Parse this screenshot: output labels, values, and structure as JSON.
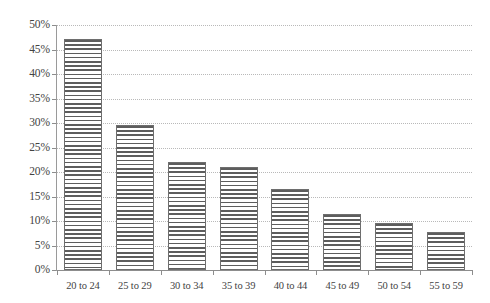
{
  "chart_data": {
    "type": "bar",
    "title": "",
    "subtitle": "",
    "xlabel": "",
    "ylabel": "",
    "categories": [
      "20 to 24",
      "25 to 29",
      "30 to 34",
      "35 to 39",
      "40 to 44",
      "45 to 49",
      "50 to 54",
      "55 to 59"
    ],
    "values": [
      47.2,
      29.5,
      22.0,
      21.0,
      16.5,
      11.5,
      9.5,
      7.8
    ],
    "series": [
      {
        "name": "",
        "values": [
          47.2,
          29.5,
          22.0,
          21.0,
          16.5,
          11.5,
          9.5,
          7.8
        ]
      }
    ],
    "ylim": [
      0,
      50
    ],
    "ytick_step": 5,
    "ytick_labels": [
      "0%",
      "5%",
      "10%",
      "15%",
      "20%",
      "25%",
      "30%",
      "35%",
      "40%",
      "45%",
      "50%"
    ],
    "ytick_values": [
      0,
      5,
      10,
      15,
      20,
      25,
      30,
      35,
      40,
      45,
      50
    ],
    "grid": "horizontal-dotted",
    "legend": "none",
    "bar_fill": "horizontal-hatch",
    "colors": {
      "bar_line": "#5d5d5d",
      "bar_border": "#6e6e6e",
      "gridline": "#b9b9b9",
      "axis": "#8d8d8d",
      "text": "#434343",
      "background": "#ffffff"
    }
  }
}
